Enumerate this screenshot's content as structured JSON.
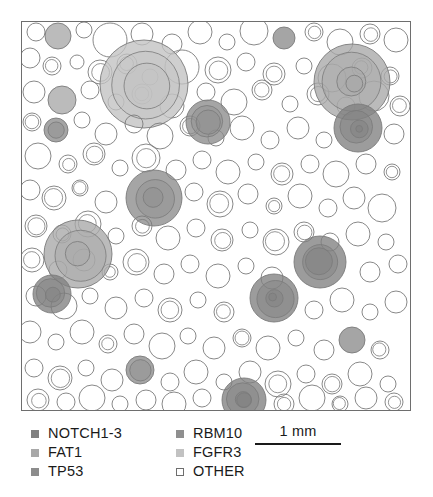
{
  "figure": {
    "title": "",
    "type": "clone-bubble-map"
  },
  "plot": {
    "background_color": "#ffffff",
    "border_color": "#6e6e6e",
    "left": 21,
    "top": 21,
    "width": 390,
    "height": 390
  },
  "legend": {
    "columns": [
      {
        "items": [
          {
            "label": "NOTCH1-3",
            "color": "#808080",
            "filled": true
          },
          {
            "label": "FAT1",
            "color": "#a8a8a8",
            "filled": true
          },
          {
            "label": "TP53",
            "color": "#8c8c8c",
            "filled": true
          }
        ]
      },
      {
        "items": [
          {
            "label": "RBM10",
            "color": "#8f8f8f",
            "filled": true
          },
          {
            "label": "FGFR3",
            "color": "#c2c2c2",
            "filled": true
          },
          {
            "label": "OTHER",
            "color": "#ffffff",
            "filled": false
          }
        ]
      }
    ]
  },
  "scalebar": {
    "label": "1 mm",
    "color": "#1a1a1a"
  },
  "chart_data": {
    "type": "scatter",
    "title": "",
    "xlabel": "",
    "ylabel": "",
    "xlim": [
      0,
      388
    ],
    "ylim": [
      0,
      388
    ],
    "grid": false,
    "legend_position": "bottom",
    "units": "pixels; scale bar = 1 mm",
    "marker": "circle",
    "encoding": {
      "x": "clone centroid x",
      "y": "clone centroid y",
      "r": "clone radius (proportional to clone area)",
      "color": "driver gene category"
    },
    "categories": [
      "NOTCH1-3",
      "FAT1",
      "TP53",
      "RBM10",
      "FGFR3",
      "OTHER"
    ],
    "category_colors": {
      "NOTCH1-3": "#808080",
      "FAT1": "#a8a8a8",
      "TP53": "#8c8c8c",
      "RBM10": "#8f8f8f",
      "FGFR3": "#c2c2c2",
      "OTHER": "#ffffff"
    },
    "fill_opacity": 0.78,
    "stroke_color": "#7a7a7a",
    "points": [
      {
        "x": 14,
        "y": 10,
        "r": 9,
        "c": "OTHER"
      },
      {
        "x": 36,
        "y": 14,
        "r": 13,
        "c": "FAT1"
      },
      {
        "x": 62,
        "y": 8,
        "r": 8,
        "c": "OTHER"
      },
      {
        "x": 88,
        "y": 18,
        "r": 17,
        "c": "OTHER"
      },
      {
        "x": 120,
        "y": 12,
        "r": 11,
        "c": "OTHER"
      },
      {
        "x": 150,
        "y": 22,
        "r": 10,
        "c": "OTHER"
      },
      {
        "x": 178,
        "y": 10,
        "r": 12,
        "c": "OTHER"
      },
      {
        "x": 205,
        "y": 20,
        "r": 8,
        "c": "OTHER"
      },
      {
        "x": 232,
        "y": 9,
        "r": 14,
        "c": "OTHER"
      },
      {
        "x": 262,
        "y": 16,
        "r": 11,
        "c": "TP53"
      },
      {
        "x": 292,
        "y": 10,
        "r": 9,
        "c": "OTHER"
      },
      {
        "x": 318,
        "y": 20,
        "r": 13,
        "c": "OTHER"
      },
      {
        "x": 348,
        "y": 12,
        "r": 10,
        "c": "OTHER"
      },
      {
        "x": 374,
        "y": 18,
        "r": 12,
        "c": "OTHER"
      },
      {
        "x": 8,
        "y": 36,
        "r": 10,
        "c": "OTHER"
      },
      {
        "x": 30,
        "y": 44,
        "r": 9,
        "c": "OTHER"
      },
      {
        "x": 55,
        "y": 40,
        "r": 7,
        "c": "OTHER"
      },
      {
        "x": 78,
        "y": 50,
        "r": 12,
        "c": "OTHER"
      },
      {
        "x": 105,
        "y": 42,
        "r": 10,
        "c": "OTHER"
      },
      {
        "x": 128,
        "y": 55,
        "r": 8,
        "c": "OTHER"
      },
      {
        "x": 160,
        "y": 45,
        "r": 17,
        "c": "OTHER"
      },
      {
        "x": 196,
        "y": 48,
        "r": 13,
        "c": "OTHER"
      },
      {
        "x": 224,
        "y": 40,
        "r": 9,
        "c": "OTHER"
      },
      {
        "x": 252,
        "y": 52,
        "r": 11,
        "c": "OTHER"
      },
      {
        "x": 282,
        "y": 44,
        "r": 8,
        "c": "OTHER"
      },
      {
        "x": 310,
        "y": 56,
        "r": 14,
        "c": "OTHER"
      },
      {
        "x": 340,
        "y": 46,
        "r": 10,
        "c": "OTHER"
      },
      {
        "x": 368,
        "y": 54,
        "r": 9,
        "c": "OTHER"
      },
      {
        "x": 12,
        "y": 70,
        "r": 11,
        "c": "OTHER"
      },
      {
        "x": 40,
        "y": 78,
        "r": 14,
        "c": "FAT1"
      },
      {
        "x": 68,
        "y": 68,
        "r": 9,
        "c": "OTHER"
      },
      {
        "x": 94,
        "y": 80,
        "r": 8,
        "c": "OTHER"
      },
      {
        "x": 120,
        "y": 72,
        "r": 10,
        "c": "OTHER"
      },
      {
        "x": 150,
        "y": 84,
        "r": 12,
        "c": "OTHER"
      },
      {
        "x": 122,
        "y": 62,
        "r": 44,
        "c": "FGFR3"
      },
      {
        "x": 184,
        "y": 70,
        "r": 9,
        "c": "OTHER"
      },
      {
        "x": 212,
        "y": 80,
        "r": 13,
        "c": "OTHER"
      },
      {
        "x": 240,
        "y": 68,
        "r": 10,
        "c": "OTHER"
      },
      {
        "x": 268,
        "y": 82,
        "r": 8,
        "c": "OTHER"
      },
      {
        "x": 296,
        "y": 72,
        "r": 11,
        "c": "OTHER"
      },
      {
        "x": 324,
        "y": 84,
        "r": 9,
        "c": "OTHER"
      },
      {
        "x": 352,
        "y": 74,
        "r": 15,
        "c": "OTHER"
      },
      {
        "x": 378,
        "y": 84,
        "r": 10,
        "c": "OTHER"
      },
      {
        "x": 330,
        "y": 60,
        "r": 38,
        "c": "FAT1"
      },
      {
        "x": 10,
        "y": 100,
        "r": 9,
        "c": "OTHER"
      },
      {
        "x": 34,
        "y": 108,
        "r": 12,
        "c": "TP53"
      },
      {
        "x": 60,
        "y": 98,
        "r": 8,
        "c": "OTHER"
      },
      {
        "x": 84,
        "y": 112,
        "r": 11,
        "c": "OTHER"
      },
      {
        "x": 112,
        "y": 102,
        "r": 9,
        "c": "OTHER"
      },
      {
        "x": 138,
        "y": 114,
        "r": 13,
        "c": "OTHER"
      },
      {
        "x": 168,
        "y": 104,
        "r": 10,
        "c": "OTHER"
      },
      {
        "x": 194,
        "y": 116,
        "r": 8,
        "c": "OTHER"
      },
      {
        "x": 220,
        "y": 106,
        "r": 12,
        "c": "OTHER"
      },
      {
        "x": 248,
        "y": 118,
        "r": 9,
        "c": "OTHER"
      },
      {
        "x": 276,
        "y": 106,
        "r": 11,
        "c": "OTHER"
      },
      {
        "x": 302,
        "y": 118,
        "r": 8,
        "c": "OTHER"
      },
      {
        "x": 186,
        "y": 100,
        "r": 22,
        "c": "TP53"
      },
      {
        "x": 336,
        "y": 106,
        "r": 24,
        "c": "NOTCH1-3"
      },
      {
        "x": 372,
        "y": 112,
        "r": 10,
        "c": "OTHER"
      },
      {
        "x": 16,
        "y": 134,
        "r": 13,
        "c": "OTHER"
      },
      {
        "x": 46,
        "y": 142,
        "r": 9,
        "c": "OTHER"
      },
      {
        "x": 72,
        "y": 132,
        "r": 11,
        "c": "OTHER"
      },
      {
        "x": 98,
        "y": 146,
        "r": 8,
        "c": "OTHER"
      },
      {
        "x": 124,
        "y": 136,
        "r": 14,
        "c": "OTHER"
      },
      {
        "x": 154,
        "y": 148,
        "r": 10,
        "c": "OTHER"
      },
      {
        "x": 180,
        "y": 138,
        "r": 9,
        "c": "OTHER"
      },
      {
        "x": 206,
        "y": 150,
        "r": 12,
        "c": "OTHER"
      },
      {
        "x": 234,
        "y": 140,
        "r": 8,
        "c": "OTHER"
      },
      {
        "x": 260,
        "y": 152,
        "r": 11,
        "c": "OTHER"
      },
      {
        "x": 288,
        "y": 142,
        "r": 9,
        "c": "OTHER"
      },
      {
        "x": 314,
        "y": 152,
        "r": 13,
        "c": "OTHER"
      },
      {
        "x": 344,
        "y": 142,
        "r": 10,
        "c": "OTHER"
      },
      {
        "x": 370,
        "y": 150,
        "r": 8,
        "c": "OTHER"
      },
      {
        "x": 8,
        "y": 168,
        "r": 10,
        "c": "OTHER"
      },
      {
        "x": 32,
        "y": 176,
        "r": 12,
        "c": "OTHER"
      },
      {
        "x": 58,
        "y": 166,
        "r": 8,
        "c": "OTHER"
      },
      {
        "x": 84,
        "y": 180,
        "r": 11,
        "c": "OTHER"
      },
      {
        "x": 132,
        "y": 176,
        "r": 28,
        "c": "TP53"
      },
      {
        "x": 172,
        "y": 170,
        "r": 9,
        "c": "OTHER"
      },
      {
        "x": 198,
        "y": 182,
        "r": 13,
        "c": "OTHER"
      },
      {
        "x": 226,
        "y": 172,
        "r": 10,
        "c": "OTHER"
      },
      {
        "x": 252,
        "y": 184,
        "r": 8,
        "c": "OTHER"
      },
      {
        "x": 278,
        "y": 174,
        "r": 12,
        "c": "OTHER"
      },
      {
        "x": 306,
        "y": 186,
        "r": 9,
        "c": "OTHER"
      },
      {
        "x": 332,
        "y": 176,
        "r": 11,
        "c": "OTHER"
      },
      {
        "x": 360,
        "y": 186,
        "r": 14,
        "c": "OTHER"
      },
      {
        "x": 14,
        "y": 204,
        "r": 11,
        "c": "OTHER"
      },
      {
        "x": 40,
        "y": 212,
        "r": 9,
        "c": "OTHER"
      },
      {
        "x": 66,
        "y": 202,
        "r": 13,
        "c": "OTHER"
      },
      {
        "x": 94,
        "y": 214,
        "r": 8,
        "c": "OTHER"
      },
      {
        "x": 120,
        "y": 204,
        "r": 10,
        "c": "OTHER"
      },
      {
        "x": 146,
        "y": 216,
        "r": 12,
        "c": "OTHER"
      },
      {
        "x": 174,
        "y": 206,
        "r": 9,
        "c": "OTHER"
      },
      {
        "x": 200,
        "y": 218,
        "r": 11,
        "c": "OTHER"
      },
      {
        "x": 228,
        "y": 208,
        "r": 8,
        "c": "OTHER"
      },
      {
        "x": 254,
        "y": 220,
        "r": 13,
        "c": "OTHER"
      },
      {
        "x": 282,
        "y": 210,
        "r": 10,
        "c": "OTHER"
      },
      {
        "x": 308,
        "y": 220,
        "r": 9,
        "c": "OTHER"
      },
      {
        "x": 336,
        "y": 212,
        "r": 12,
        "c": "OTHER"
      },
      {
        "x": 364,
        "y": 220,
        "r": 8,
        "c": "OTHER"
      },
      {
        "x": 10,
        "y": 238,
        "r": 12,
        "c": "OTHER"
      },
      {
        "x": 36,
        "y": 248,
        "r": 9,
        "c": "OTHER"
      },
      {
        "x": 62,
        "y": 238,
        "r": 11,
        "c": "OTHER"
      },
      {
        "x": 88,
        "y": 250,
        "r": 8,
        "c": "OTHER"
      },
      {
        "x": 114,
        "y": 240,
        "r": 13,
        "c": "OTHER"
      },
      {
        "x": 142,
        "y": 252,
        "r": 10,
        "c": "OTHER"
      },
      {
        "x": 168,
        "y": 242,
        "r": 9,
        "c": "OTHER"
      },
      {
        "x": 196,
        "y": 254,
        "r": 12,
        "c": "OTHER"
      },
      {
        "x": 224,
        "y": 244,
        "r": 8,
        "c": "OTHER"
      },
      {
        "x": 250,
        "y": 256,
        "r": 11,
        "c": "OTHER"
      },
      {
        "x": 298,
        "y": 240,
        "r": 26,
        "c": "NOTCH1-3"
      },
      {
        "x": 348,
        "y": 250,
        "r": 10,
        "c": "OTHER"
      },
      {
        "x": 376,
        "y": 242,
        "r": 9,
        "c": "OTHER"
      },
      {
        "x": 56,
        "y": 232,
        "r": 34,
        "c": "FAT1"
      },
      {
        "x": 14,
        "y": 274,
        "r": 10,
        "c": "OTHER"
      },
      {
        "x": 42,
        "y": 284,
        "r": 13,
        "c": "OTHER"
      },
      {
        "x": 68,
        "y": 274,
        "r": 8,
        "c": "OTHER"
      },
      {
        "x": 94,
        "y": 286,
        "r": 11,
        "c": "OTHER"
      },
      {
        "x": 122,
        "y": 276,
        "r": 9,
        "c": "OTHER"
      },
      {
        "x": 148,
        "y": 288,
        "r": 12,
        "c": "OTHER"
      },
      {
        "x": 176,
        "y": 278,
        "r": 8,
        "c": "OTHER"
      },
      {
        "x": 202,
        "y": 290,
        "r": 10,
        "c": "OTHER"
      },
      {
        "x": 252,
        "y": 276,
        "r": 24,
        "c": "NOTCH1-3"
      },
      {
        "x": 292,
        "y": 288,
        "r": 9,
        "c": "OTHER"
      },
      {
        "x": 320,
        "y": 278,
        "r": 12,
        "c": "OTHER"
      },
      {
        "x": 348,
        "y": 290,
        "r": 8,
        "c": "OTHER"
      },
      {
        "x": 374,
        "y": 280,
        "r": 11,
        "c": "OTHER"
      },
      {
        "x": 30,
        "y": 272,
        "r": 19,
        "c": "NOTCH1-3"
      },
      {
        "x": 8,
        "y": 310,
        "r": 11,
        "c": "OTHER"
      },
      {
        "x": 34,
        "y": 320,
        "r": 8,
        "c": "OTHER"
      },
      {
        "x": 60,
        "y": 310,
        "r": 12,
        "c": "OTHER"
      },
      {
        "x": 86,
        "y": 322,
        "r": 9,
        "c": "OTHER"
      },
      {
        "x": 112,
        "y": 312,
        "r": 10,
        "c": "OTHER"
      },
      {
        "x": 140,
        "y": 324,
        "r": 13,
        "c": "OTHER"
      },
      {
        "x": 166,
        "y": 314,
        "r": 8,
        "c": "OTHER"
      },
      {
        "x": 192,
        "y": 326,
        "r": 11,
        "c": "OTHER"
      },
      {
        "x": 220,
        "y": 316,
        "r": 9,
        "c": "OTHER"
      },
      {
        "x": 246,
        "y": 326,
        "r": 12,
        "c": "OTHER"
      },
      {
        "x": 274,
        "y": 316,
        "r": 8,
        "c": "OTHER"
      },
      {
        "x": 302,
        "y": 328,
        "r": 10,
        "c": "OTHER"
      },
      {
        "x": 330,
        "y": 318,
        "r": 13,
        "c": "TP53"
      },
      {
        "x": 358,
        "y": 328,
        "r": 9,
        "c": "OTHER"
      },
      {
        "x": 12,
        "y": 346,
        "r": 9,
        "c": "OTHER"
      },
      {
        "x": 38,
        "y": 356,
        "r": 12,
        "c": "OTHER"
      },
      {
        "x": 64,
        "y": 346,
        "r": 8,
        "c": "OTHER"
      },
      {
        "x": 90,
        "y": 358,
        "r": 11,
        "c": "OTHER"
      },
      {
        "x": 118,
        "y": 348,
        "r": 14,
        "c": "TP53"
      },
      {
        "x": 148,
        "y": 360,
        "r": 9,
        "c": "OTHER"
      },
      {
        "x": 174,
        "y": 350,
        "r": 12,
        "c": "OTHER"
      },
      {
        "x": 202,
        "y": 360,
        "r": 8,
        "c": "OTHER"
      },
      {
        "x": 228,
        "y": 350,
        "r": 11,
        "c": "OTHER"
      },
      {
        "x": 256,
        "y": 362,
        "r": 13,
        "c": "OTHER"
      },
      {
        "x": 284,
        "y": 352,
        "r": 9,
        "c": "OTHER"
      },
      {
        "x": 310,
        "y": 362,
        "r": 10,
        "c": "OTHER"
      },
      {
        "x": 338,
        "y": 352,
        "r": 12,
        "c": "OTHER"
      },
      {
        "x": 366,
        "y": 362,
        "r": 8,
        "c": "OTHER"
      },
      {
        "x": 16,
        "y": 378,
        "r": 11,
        "c": "OTHER"
      },
      {
        "x": 44,
        "y": 380,
        "r": 9,
        "c": "OTHER"
      },
      {
        "x": 70,
        "y": 376,
        "r": 13,
        "c": "OTHER"
      },
      {
        "x": 98,
        "y": 382,
        "r": 8,
        "c": "OTHER"
      },
      {
        "x": 124,
        "y": 378,
        "r": 10,
        "c": "OTHER"
      },
      {
        "x": 152,
        "y": 382,
        "r": 12,
        "c": "OTHER"
      },
      {
        "x": 180,
        "y": 376,
        "r": 9,
        "c": "OTHER"
      },
      {
        "x": 222,
        "y": 378,
        "r": 22,
        "c": "NOTCH1-3"
      },
      {
        "x": 262,
        "y": 382,
        "r": 10,
        "c": "OTHER"
      },
      {
        "x": 290,
        "y": 376,
        "r": 13,
        "c": "OTHER"
      },
      {
        "x": 318,
        "y": 382,
        "r": 8,
        "c": "OTHER"
      },
      {
        "x": 344,
        "y": 376,
        "r": 11,
        "c": "OTHER"
      },
      {
        "x": 372,
        "y": 380,
        "r": 9,
        "c": "OTHER"
      }
    ]
  }
}
